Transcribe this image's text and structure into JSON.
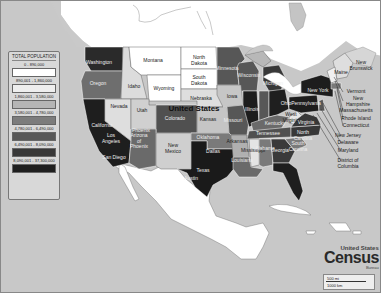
{
  "map": {
    "title": "United States",
    "subject": "Total Population by State"
  },
  "legend": {
    "title": "TOTAL POPULATION",
    "items": [
      {
        "range": "0 - 890,000",
        "color": "#ffffff"
      },
      {
        "range": "890,001 - 1,860,000",
        "color": "#eeeeee"
      },
      {
        "range": "1,860,001 - 3,580,000",
        "color": "#b5b5b5"
      },
      {
        "range": "3,580,001 - 4,780,000",
        "color": "#7c7c7c"
      },
      {
        "range": "4,780,001 - 6,490,000",
        "color": "#575757"
      },
      {
        "range": "6,490,001 - 8,090,000",
        "color": "#383838"
      },
      {
        "range": "8,090,001 - 37,300,000",
        "color": "#1f1f1f"
      }
    ]
  },
  "states": [
    {
      "name": "Washington",
      "x": 98,
      "y": 62
    },
    {
      "name": "Oregon",
      "x": 97,
      "y": 83
    },
    {
      "name": "Idaho",
      "x": 133,
      "y": 86
    },
    {
      "name": "Montana",
      "x": 152,
      "y": 60
    },
    {
      "name": "North\nDakota",
      "x": 198,
      "y": 59
    },
    {
      "name": "South\nDakota",
      "x": 198,
      "y": 79
    },
    {
      "name": "Wyoming",
      "x": 163,
      "y": 88
    },
    {
      "name": "Nebraska",
      "x": 200,
      "y": 98
    },
    {
      "name": "Nevada",
      "x": 118,
      "y": 106
    },
    {
      "name": "Utah",
      "x": 141,
      "y": 110
    },
    {
      "name": "Colorado",
      "x": 174,
      "y": 118
    },
    {
      "name": "Kansas",
      "x": 207,
      "y": 119
    },
    {
      "name": "Iowa",
      "x": 231,
      "y": 96
    },
    {
      "name": "Minnesota",
      "x": 226,
      "y": 68
    },
    {
      "name": "Wisconsin",
      "x": 248,
      "y": 75
    },
    {
      "name": "Michigan",
      "x": 272,
      "y": 83
    },
    {
      "name": "California",
      "x": 101,
      "y": 125
    },
    {
      "name": "Los\nAngeles",
      "x": 110,
      "y": 137
    },
    {
      "name": "San Diego",
      "x": 113,
      "y": 157
    },
    {
      "name": "Arizona\nof\nPhoenix",
      "x": 138,
      "y": 140
    },
    {
      "name": "Phoenix",
      "x": 140,
      "y": 130
    },
    {
      "name": "New\nMexico",
      "x": 172,
      "y": 147
    },
    {
      "name": "Oklahoma",
      "x": 207,
      "y": 137
    },
    {
      "name": "Texas",
      "x": 202,
      "y": 170
    },
    {
      "name": "Dallas",
      "x": 212,
      "y": 151
    },
    {
      "name": "Austin",
      "x": 190,
      "y": 178
    },
    {
      "name": "Arkansas",
      "x": 236,
      "y": 141
    },
    {
      "name": "Louisiana",
      "x": 241,
      "y": 160
    },
    {
      "name": "Mississippi",
      "x": 252,
      "y": 150
    },
    {
      "name": "Alabama",
      "x": 264,
      "y": 148
    },
    {
      "name": "Georgia",
      "x": 279,
      "y": 150
    },
    {
      "name": "Missouri",
      "x": 232,
      "y": 120
    },
    {
      "name": "Illinois",
      "x": 251,
      "y": 109
    },
    {
      "name": "Ohio",
      "x": 285,
      "y": 103
    },
    {
      "name": "Kentucky",
      "x": 274,
      "y": 123
    },
    {
      "name": "Tennessee",
      "x": 267,
      "y": 133
    },
    {
      "name": "West\nVirginia",
      "x": 290,
      "y": 116
    },
    {
      "name": "Virginia",
      "x": 305,
      "y": 122
    },
    {
      "name": "North\nCarolina",
      "x": 302,
      "y": 134
    },
    {
      "name": "South\nCarolina",
      "x": 297,
      "y": 145
    },
    {
      "name": "Pennsylvania",
      "x": 305,
      "y": 103
    },
    {
      "name": "New York",
      "x": 317,
      "y": 90
    },
    {
      "name": "Maine",
      "x": 340,
      "y": 72
    },
    {
      "name": "New\nBrunswick",
      "x": 360,
      "y": 64
    }
  ],
  "callouts": [
    {
      "name": "Vermont",
      "x": 355,
      "y": 91
    },
    {
      "name": "New\nHampshire",
      "x": 357,
      "y": 100
    },
    {
      "name": "Massachusetts",
      "x": 355,
      "y": 110
    },
    {
      "name": "Rhode Island",
      "x": 355,
      "y": 118
    },
    {
      "name": "Connecticut",
      "x": 355,
      "y": 125
    },
    {
      "name": "New Jersey",
      "x": 347,
      "y": 135
    },
    {
      "name": "Delaware",
      "x": 347,
      "y": 142
    },
    {
      "name": "Maryland",
      "x": 347,
      "y": 150
    },
    {
      "name": "District of\nColumbia",
      "x": 347,
      "y": 162
    }
  ],
  "logo": {
    "line1": "United States",
    "line2": "Census",
    "line3": "Bureau"
  },
  "scale": {
    "miles": "500 mi",
    "km": "1000 km"
  }
}
